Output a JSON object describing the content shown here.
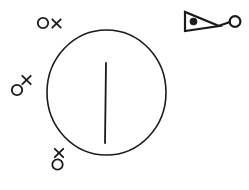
{
  "figure": {
    "background_color": "#ffffff",
    "ink_color": "#1a1a1a",
    "width": 249,
    "height": 190,
    "main_circle": {
      "label": "large circle",
      "cx": 106.5,
      "cy": 92.5,
      "rx": 59.5,
      "ry": 62.5,
      "stroke_width": 1.6
    },
    "inner_line": {
      "label": "vertical line inside circle",
      "x1": 106,
      "y1": 63,
      "x2": 105,
      "y2": 143,
      "stroke_width": 1.8
    },
    "marker_pairs": [
      {
        "name": "marker-pair-top-left",
        "arrangement": "horizontal",
        "circle": {
          "cx": 43,
          "cy": 23,
          "r": 5.2,
          "stroke_width": 1.8
        },
        "cross": {
          "cx": 56.5,
          "cy": 23.5,
          "size": 4.2,
          "stroke_width": 1.8
        }
      },
      {
        "name": "marker-pair-left-middle",
        "arrangement": "diagonal",
        "circle": {
          "cx": 17,
          "cy": 90,
          "r": 5.2,
          "stroke_width": 1.8
        },
        "cross": {
          "cx": 26.5,
          "cy": 80,
          "size": 4.2,
          "stroke_width": 1.8
        }
      },
      {
        "name": "marker-pair-bottom-left",
        "arrangement": "diagonal",
        "circle": {
          "cx": 57.5,
          "cy": 164.5,
          "r": 5.2,
          "stroke_width": 1.8
        },
        "cross": {
          "cx": 59,
          "cy": 153,
          "size": 4.2,
          "stroke_width": 1.8
        }
      }
    ],
    "flag_glyph": {
      "label": "triangle with dot connected to small circle",
      "triangle": {
        "points": "185,12 185,31 219,26",
        "stroke_width": 2.2
      },
      "dot": {
        "cx": 193.5,
        "cy": 21.5,
        "r": 3.6
      },
      "connector": {
        "x1": 219,
        "y1": 26,
        "x2": 229.5,
        "y2": 22,
        "stroke_width": 2.2
      },
      "circle": {
        "cx": 235,
        "cy": 21.5,
        "r": 5.4,
        "stroke_width": 2.2
      }
    }
  },
  "accessibility": {
    "description": "A large open circle containing a short vertical line, three small circle-and-x marker pairs arranged along the left side, and a right-pointing filled-dot triangle joined by a line to a small open circle in the upper right."
  }
}
